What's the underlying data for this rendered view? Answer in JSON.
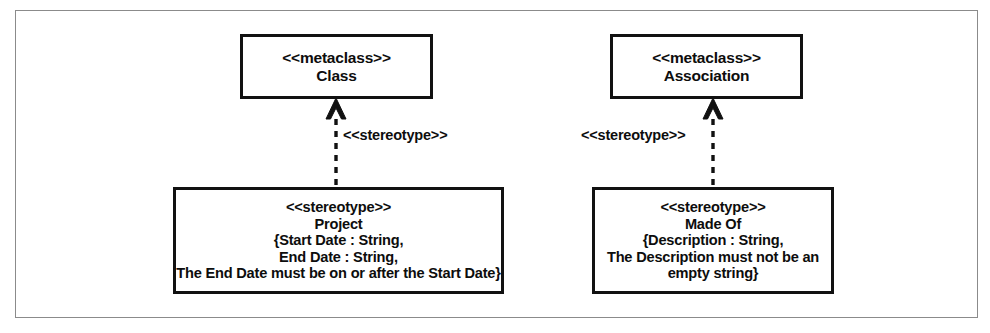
{
  "diagram": {
    "frame_color": "#8b8b8b",
    "box_border_color": "#111111",
    "text_color": "#0d0d0d",
    "background": "#ffffff"
  },
  "nodes": {
    "metaclass_class": {
      "keyword": "<<metaclass>>",
      "name": "Class"
    },
    "metaclass_association": {
      "keyword": "<<metaclass>>",
      "name": "Association"
    },
    "stereotype_project": {
      "keyword": "<<stereotype>>",
      "name": "Project",
      "constraint_lines": [
        "{Start Date : String,",
        "End Date : String,",
        "The End Date must be on or after the Start Date}"
      ]
    },
    "stereotype_made_of": {
      "keyword": "<<stereotype>>",
      "name": "Made Of",
      "constraint_lines": [
        "{Description : String,",
        "The Description must not be an",
        "empty string}"
      ]
    }
  },
  "edges": {
    "left": {
      "label": "<<stereotype>>",
      "style": "dashed",
      "arrowhead": "hollow-triangle",
      "direction": "up"
    },
    "right": {
      "label": "<<stereotype>>",
      "style": "dashed",
      "arrowhead": "hollow-triangle",
      "direction": "up"
    }
  }
}
